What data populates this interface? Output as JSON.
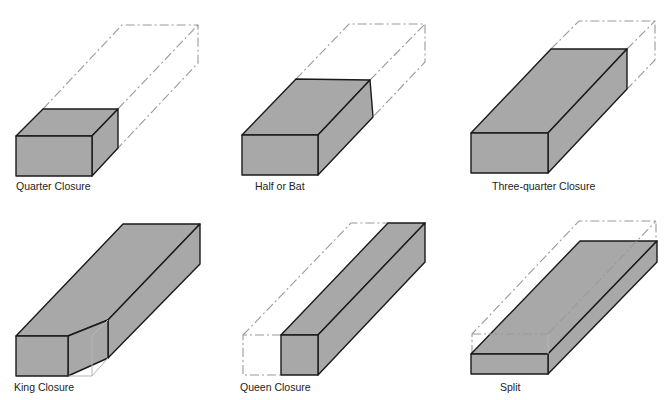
{
  "colors": {
    "brick_fill": "#a8a8a8",
    "outline": "#1a1a1a",
    "ghost_outline": "#9a9a9a",
    "background": "#ffffff"
  },
  "figures": [
    {
      "id": "quarter-closure",
      "label": "Quarter Closure"
    },
    {
      "id": "half-or-bat",
      "label": "Half or Bat"
    },
    {
      "id": "three-quarter-closure",
      "label": "Three-quarter Closure"
    },
    {
      "id": "king-closure",
      "label": "King Closure"
    },
    {
      "id": "queen-closure",
      "label": "Queen Closure"
    },
    {
      "id": "split",
      "label": "Split"
    }
  ]
}
